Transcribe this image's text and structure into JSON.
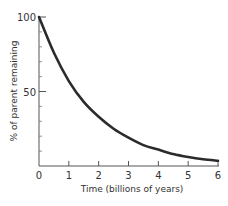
{
  "chart_data": {
    "type": "line",
    "title": "",
    "xlabel": "Time (billions of years)",
    "ylabel": "% of parent remaining",
    "x_ticks": [
      "0",
      "1",
      "2",
      "3",
      "4",
      "5",
      "6"
    ],
    "y_ticks": [
      "100",
      "50"
    ],
    "y_minor_ticks": [
      10,
      20,
      30,
      40,
      60,
      70,
      80,
      90
    ],
    "xlim": [
      0,
      6
    ],
    "ylim": [
      0,
      100
    ],
    "grid": false,
    "legend": null,
    "series": [
      {
        "name": "parent remaining",
        "x": [
          0,
          0.5,
          1,
          1.5,
          2,
          2.5,
          3,
          3.5,
          4,
          4.5,
          5,
          5.5,
          6
        ],
        "values": [
          100,
          76,
          57,
          43,
          33,
          25,
          19,
          14,
          11,
          8,
          6,
          4.5,
          3.5
        ]
      }
    ],
    "color": "#2b2b2b"
  }
}
